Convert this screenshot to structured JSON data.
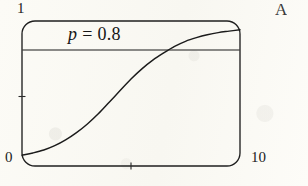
{
  "figure": {
    "background_color": "#fdfcf8",
    "ink_color": "#1b1b1b",
    "y_max_label": "1",
    "y_min_label": "0",
    "x_max_label": "10",
    "threshold_label_symbol": "p",
    "threshold_label_equals": "=",
    "threshold_label_value": "0.8",
    "threshold_label_full": "p = 0.8"
  },
  "margin": {
    "clipped_text": "A"
  },
  "chart_data": {
    "type": "line",
    "title": "",
    "subtitle": "",
    "xlabel": "",
    "ylabel": "",
    "xlim": [
      0,
      10
    ],
    "ylim": [
      0,
      1
    ],
    "xticks": [
      0,
      5,
      10
    ],
    "xticklabels": [
      "0",
      "",
      "10"
    ],
    "yticks": [
      0,
      0.5,
      1
    ],
    "yticklabels": [
      "0",
      "",
      "1"
    ],
    "grid": false,
    "legend": null,
    "frame": "rounded-rectangle",
    "annotations": [
      {
        "text": "p = 0.8",
        "x": 2.6,
        "y": 0.93,
        "kind": "threshold-label"
      }
    ],
    "series": [
      {
        "name": "logistic-curve",
        "kind": "curve",
        "color": "#1b1b1b",
        "x": [
          0,
          0.5,
          1,
          1.5,
          2,
          2.5,
          3,
          3.5,
          4,
          4.5,
          5,
          5.5,
          6,
          6.5,
          7,
          7.5,
          8,
          8.5,
          9,
          9.5,
          10
        ],
        "y": [
          0.075,
          0.09,
          0.11,
          0.14,
          0.18,
          0.23,
          0.29,
          0.36,
          0.44,
          0.52,
          0.6,
          0.67,
          0.73,
          0.78,
          0.825,
          0.86,
          0.885,
          0.905,
          0.92,
          0.93,
          0.94
        ]
      },
      {
        "name": "threshold-line",
        "kind": "horizontal-line",
        "color": "#1b1b1b",
        "y_value": 0.8,
        "x_range": [
          0,
          10
        ]
      }
    ],
    "intersection": {
      "x": 6.4,
      "y": 0.8
    }
  }
}
